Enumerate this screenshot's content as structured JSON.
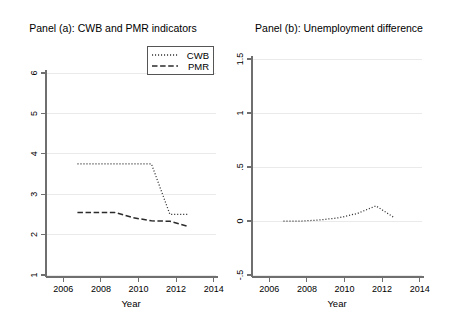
{
  "figure": {
    "background": "#ffffff",
    "width": 452,
    "height": 323,
    "panel_count": 2
  },
  "chart_data": [
    {
      "type": "line",
      "panel": "a",
      "title": "Panel (a): CWB and PMR indicators",
      "xlabel": "Year",
      "ylabel": "",
      "xlim": [
        2005.3,
        2014.6
      ],
      "ylim": [
        1,
        6
      ],
      "xticks": [
        2006,
        2008,
        2010,
        2012,
        2014
      ],
      "xticklabels": [
        "2006",
        "2008",
        "2010",
        "2012",
        "2014"
      ],
      "yticks": [
        1,
        2,
        3,
        4,
        5,
        6
      ],
      "yticklabels": [
        "1",
        "2",
        "3",
        "4",
        "5",
        "6"
      ],
      "grid": true,
      "grid_axis": "y",
      "legend": true,
      "legend_position": "upper right",
      "x": [
        2007,
        2008,
        2009,
        2010,
        2011,
        2012,
        2013
      ],
      "series": [
        {
          "name": "CWB",
          "linestyle": "dotted",
          "color": "#333333",
          "values": [
            3.75,
            3.75,
            3.75,
            3.75,
            3.75,
            2.5,
            2.5
          ]
        },
        {
          "name": "PMR",
          "linestyle": "dashed",
          "color": "#2b2b2b",
          "values": [
            2.55,
            2.55,
            2.55,
            2.42,
            2.34,
            2.33,
            2.2
          ]
        }
      ]
    },
    {
      "type": "line",
      "panel": "b",
      "title": "Panel (b): Unemployment difference",
      "xlabel": "Year",
      "ylabel": "",
      "xlim": [
        2005.3,
        2014.6
      ],
      "ylim": [
        -0.5,
        1.5
      ],
      "xticks": [
        2006,
        2008,
        2010,
        2012,
        2014
      ],
      "xticklabels": [
        "2006",
        "2008",
        "2010",
        "2012",
        "2014"
      ],
      "yticks": [
        -0.5,
        0,
        0.5,
        1,
        1.5
      ],
      "yticklabels": [
        "-.5",
        "0",
        ".5",
        "1",
        "1.5"
      ],
      "grid": true,
      "grid_axis": "y",
      "legend": false,
      "x": [
        2007,
        2008,
        2009,
        2010,
        2011,
        2012,
        2013
      ],
      "series": [
        {
          "name": "Unemployment difference",
          "linestyle": "dotted",
          "color": "#333333",
          "values": [
            0.0,
            0.0,
            0.01,
            0.03,
            0.07,
            0.14,
            0.03
          ]
        }
      ]
    }
  ],
  "panel_a": {
    "title": "Panel (a): CWB and PMR indicators",
    "xlabel": "Year",
    "ytick_labels": [
      "6",
      "5",
      "4",
      "3",
      "2",
      "1"
    ],
    "xtick_labels": [
      "2006",
      "2008",
      "2010",
      "2012",
      "2014"
    ],
    "legend": {
      "entries": [
        {
          "label": "CWB",
          "style": "dotted"
        },
        {
          "label": "PMR",
          "style": "dashed"
        }
      ]
    }
  },
  "panel_b": {
    "title": "Panel (b): Unemployment difference",
    "xlabel": "Year",
    "ytick_labels": [
      "1.5",
      "1",
      ".5",
      "0",
      "-.5"
    ],
    "xtick_labels": [
      "2006",
      "2008",
      "2010",
      "2012",
      "2014"
    ]
  }
}
